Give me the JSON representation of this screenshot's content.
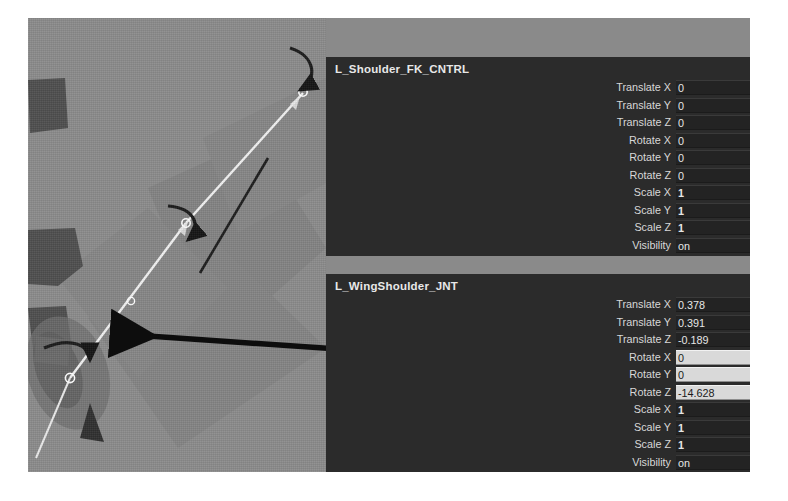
{
  "app": {
    "background_color": "#8a8a8a",
    "panel_color": "#2b2b2b",
    "viewport_color": "#8b8b8b"
  },
  "viewport": {
    "name": "3d-viewport",
    "joint_chain_color": "#f0f0f0",
    "annotation_arrow_color": "#111111",
    "rotation_arrow_color": "#1a1a1a",
    "geometry_color": "#5e5e5e"
  },
  "panels": [
    {
      "title": "L_Shoulder_FK_CNTRL",
      "attributes": [
        {
          "label": "Translate X",
          "value": "0",
          "field": false,
          "bold": false
        },
        {
          "label": "Translate Y",
          "value": "0",
          "field": false,
          "bold": false
        },
        {
          "label": "Translate Z",
          "value": "0",
          "field": false,
          "bold": false
        },
        {
          "label": "Rotate X",
          "value": "0",
          "field": false,
          "bold": false
        },
        {
          "label": "Rotate Y",
          "value": "0",
          "field": false,
          "bold": false
        },
        {
          "label": "Rotate Z",
          "value": "0",
          "field": false,
          "bold": false
        },
        {
          "label": "Scale X",
          "value": "1",
          "field": false,
          "bold": true
        },
        {
          "label": "Scale Y",
          "value": "1",
          "field": false,
          "bold": true
        },
        {
          "label": "Scale Z",
          "value": "1",
          "field": false,
          "bold": true
        },
        {
          "label": "Visibility",
          "value": "on",
          "field": false,
          "bold": false
        }
      ]
    },
    {
      "title": "L_WingShoulder_JNT",
      "attributes": [
        {
          "label": "Translate X",
          "value": "0.378",
          "field": false,
          "bold": false
        },
        {
          "label": "Translate Y",
          "value": "0.391",
          "field": false,
          "bold": false
        },
        {
          "label": "Translate Z",
          "value": "-0.189",
          "field": false,
          "bold": false
        },
        {
          "label": "Rotate X",
          "value": "0",
          "field": true,
          "bold": false
        },
        {
          "label": "Rotate Y",
          "value": "0",
          "field": true,
          "bold": false
        },
        {
          "label": "Rotate Z",
          "value": "-14.628",
          "field": true,
          "bold": false
        },
        {
          "label": "Scale X",
          "value": "1",
          "field": false,
          "bold": true
        },
        {
          "label": "Scale Y",
          "value": "1",
          "field": false,
          "bold": true
        },
        {
          "label": "Scale Z",
          "value": "1",
          "field": false,
          "bold": true
        },
        {
          "label": "Visibility",
          "value": "on",
          "field": false,
          "bold": false
        }
      ]
    }
  ]
}
